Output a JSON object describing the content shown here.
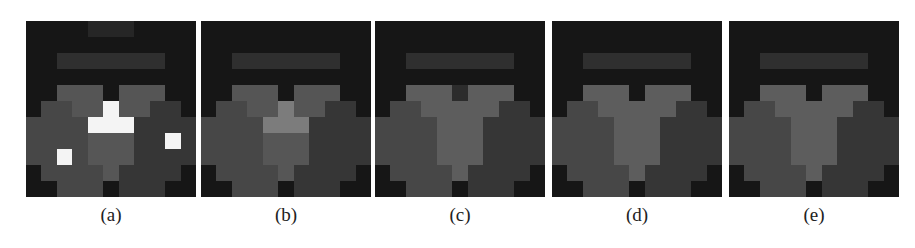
{
  "figure": {
    "palette": {
      "B": "#161616",
      "T": "#262626",
      "S": "#2f2f2f",
      "D": "#2c2c2c",
      "M": "#474747",
      "R": "#363636",
      "G": "#555555",
      "L": "#5d5d5d",
      "P": "#7c7c7c",
      "C": "#565656",
      "W": "#f4f4f4"
    },
    "panels": [
      {
        "label": "(a)",
        "left": 26,
        "rows": [
          "BBBBTTTBBBB",
          "BBBBBBBBBBB",
          "BBSSSSSSSBB",
          "BBBBBBBBBBB",
          "BBGGGBGGGBB",
          "BMMGGWGGRRB",
          "MMMMWWWRRRR",
          "MMMMCCCRRWR",
          "MMWMCCCRRRR",
          "BMMMMCRRRRB",
          "BBMMMBRRRBB"
        ]
      },
      {
        "label": "(b)",
        "left": 201,
        "rows": [
          "BBBBBBBBBBB",
          "BBBBBBBBBBB",
          "BBSSSSSSSBB",
          "BBBBBBBBBBB",
          "BBGGGBGGGBB",
          "BMMGGPGGRRB",
          "MMMMPPPRRRR",
          "MMMMCCCRRRR",
          "MMMMCCCRRRR",
          "BMMMMCRRRRB",
          "BBMMMBRRRBB"
        ]
      },
      {
        "label": "(c)",
        "left": 375,
        "rows": [
          "BBBBBBBBBBB",
          "BBBBBBBBBBB",
          "BBSSSSSSSBB",
          "BBBBBBBBBBB",
          "BBLLLDLLLBB",
          "BMMLLLLLRRB",
          "MMMMLLLRRRR",
          "MMMMLLLRRRR",
          "MMMMLLLRRRR",
          "BMMMMLRRRRB",
          "BBMMMBRRRBB"
        ]
      },
      {
        "label": "(d)",
        "left": 552,
        "rows": [
          "BBBBBBBBBBB",
          "BBBBBBBBBBB",
          "BBSSSSSSSBB",
          "BBBBBBBBBBB",
          "BBLLLBLLLBB",
          "BMMLLLLLRRB",
          "MMMMLLLRRRR",
          "MMMMLLLRRRR",
          "MMMMLLLRRRR",
          "BMMMMLRRRRB",
          "BBMMMBRRRBB"
        ]
      },
      {
        "label": "(e)",
        "left": 729,
        "rows": [
          "BBBBBBBBBBB",
          "BBBBBBBBBBB",
          "BBSSSSSSSBB",
          "BBBBBBBBBBB",
          "BBLLLBLLLBB",
          "BMMLLLLLRRB",
          "MMMMLLLRRRR",
          "MMMMLLLRRRR",
          "MMMMLLLRRRR",
          "BMMMMLRRRRB",
          "BBMMMBRRRBB"
        ]
      }
    ]
  }
}
